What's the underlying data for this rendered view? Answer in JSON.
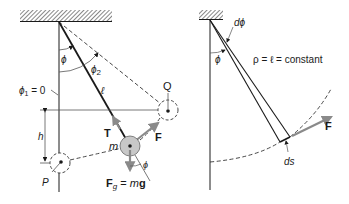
{
  "figure": {
    "left_panel": {
      "labels": {
        "phi": "ϕ",
        "phi2": "ϕ",
        "phi2_sub": "2",
        "phi1_eq": "ϕ",
        "phi1_sub": "1",
        "phi1_val": " = 0",
        "ell": "ℓ",
        "Q": "Q",
        "P": "P",
        "h": "h",
        "T": "T",
        "m": "m",
        "F": "F",
        "phi_bob": "ϕ",
        "Fg_F": "F",
        "Fg_sub": "g",
        "Fg_eq": " = ",
        "Fg_m": "m",
        "Fg_g": "g"
      }
    },
    "right_panel": {
      "labels": {
        "dphi": "dϕ",
        "phi": "ϕ",
        "rho_eq": "ρ = ℓ = constant",
        "ds": "ds",
        "F": "F"
      }
    },
    "colors": {
      "line": "#1a1a1a",
      "force_arrow": "#8a8a8a",
      "bob_fill": "#c8c8c8"
    }
  }
}
